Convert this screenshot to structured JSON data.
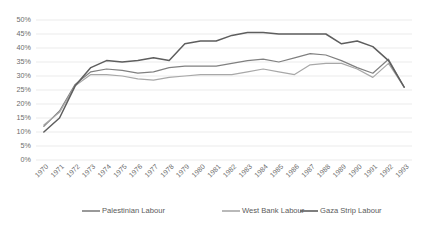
{
  "chart_data": {
    "type": "line",
    "title": "",
    "xlabel": "",
    "ylabel": "",
    "ylim": [
      0,
      50
    ],
    "ytick_labels": [
      "50%",
      "45%",
      "40%",
      "35%",
      "30%",
      "25%",
      "20%",
      "15%",
      "10%",
      "5%",
      "0%"
    ],
    "ytick_values": [
      50,
      45,
      40,
      35,
      30,
      25,
      20,
      15,
      10,
      5,
      0
    ],
    "grid": true,
    "grid_axis": "y",
    "legend_position": "bottom",
    "categories": [
      "1970",
      "1971",
      "1972",
      "1973",
      "1974",
      "1975",
      "1976",
      "1977",
      "1978",
      "1979",
      "1980",
      "1981",
      "1982",
      "1983",
      "1984",
      "1985",
      "1986",
      "1987",
      "1988",
      "1989",
      "1990",
      "1991",
      "1992",
      "1993"
    ],
    "series": [
      {
        "name": "Palestinian Labour",
        "color": "#808080",
        "values": [
          12.0,
          17.5,
          27.0,
          31.5,
          32.5,
          32.0,
          31.0,
          31.5,
          33.0,
          33.5,
          33.5,
          33.5,
          34.5,
          35.5,
          36.0,
          35.0,
          36.5,
          38.0,
          37.5,
          35.5,
          33.0,
          31.0,
          36.0,
          26.0
        ]
      },
      {
        "name": "West Bank Labour",
        "color": "#a8a8a8",
        "values": [
          12.5,
          17.0,
          26.5,
          30.5,
          30.5,
          30.0,
          29.0,
          28.5,
          29.5,
          30.0,
          30.5,
          30.5,
          30.5,
          31.5,
          32.5,
          31.5,
          30.5,
          34.0,
          34.5,
          34.5,
          32.5,
          29.5,
          34.5,
          26.0
        ]
      },
      {
        "name": "Gaza Strip Labour",
        "color": "#5e5e5e",
        "values": [
          10.0,
          15.0,
          26.5,
          33.0,
          35.5,
          35.0,
          35.5,
          36.5,
          35.5,
          41.5,
          42.5,
          42.5,
          44.5,
          45.5,
          45.5,
          45.0,
          45.0,
          45.0,
          45.0,
          41.5,
          42.5,
          40.5,
          35.5,
          26.0
        ]
      }
    ]
  },
  "legend": {
    "items": [
      {
        "label": "Palestinian Labour",
        "color": "#808080"
      },
      {
        "label": "West Bank Labour",
        "color": "#a8a8a8"
      },
      {
        "label": "Gaza Strip Labour",
        "color": "#5e5e5e"
      }
    ]
  }
}
